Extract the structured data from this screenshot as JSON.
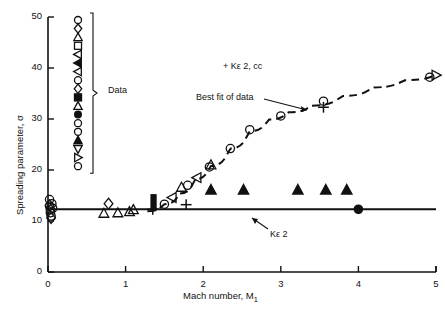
{
  "figure": {
    "background": "#ffffff",
    "ink": "#111111"
  },
  "axes": {
    "x_title": "Mach number, M",
    "x_title_sub": "1",
    "y_title": "Spreading parameter, σ",
    "x_ticks": [
      "0",
      "1",
      "2",
      "3",
      "4",
      "5"
    ],
    "y_ticks": [
      "0",
      "10",
      "20",
      "30",
      "40",
      "50"
    ]
  },
  "annotations": {
    "ke2cc": "+ Kε 2, cc",
    "best_fit": "Best fit of data",
    "ke2": "Kε 2",
    "data_legend": "Data"
  },
  "legend_symbols": [
    "circle-open",
    "diamond-open",
    "triangle-up-small-open",
    "square-open",
    "triangle-left-open-1",
    "triangle-left-filled",
    "triangle-left-open-2",
    "circle-small-open",
    "diamond-open-2",
    "square-filled",
    "triangle-up-open",
    "circle-filled",
    "circle-open-2",
    "circle-open-3",
    "triangle-up-filled",
    "triangle-down-open",
    "triangle-right-open",
    "circle-open-4"
  ],
  "chart_data": {
    "type": "scatter",
    "title": "",
    "xlabel": "Mach number, M1",
    "ylabel": "Spreading parameter, σ",
    "xlim": [
      0,
      5
    ],
    "ylim": [
      0,
      50
    ],
    "xticks": [
      0,
      1,
      2,
      3,
      4,
      5
    ],
    "yticks": [
      0,
      10,
      20,
      30,
      40,
      50
    ],
    "grid": false,
    "legend_position": "upper-left-inset",
    "series": [
      {
        "name": "Data (open circles, subsonic cluster)",
        "marker": "circle-open",
        "points": [
          [
            0.02,
            14.2
          ],
          [
            0.02,
            12.9
          ],
          [
            0.03,
            12.2
          ],
          [
            0.03,
            11.6
          ],
          [
            0.04,
            11.0
          ],
          [
            0.05,
            13.4
          ],
          [
            0.06,
            12.5
          ]
        ]
      },
      {
        "name": "Data (open diamonds, low Mach)",
        "marker": "diamond-open",
        "points": [
          [
            0.02,
            13.1
          ],
          [
            0.04,
            10.6
          ],
          [
            0.78,
            13.4
          ]
        ]
      },
      {
        "name": "Data (open triangles, rising branch)",
        "marker": "triangle-up-open",
        "points": [
          [
            0.72,
            11.5
          ],
          [
            0.9,
            11.6
          ],
          [
            1.05,
            11.8
          ],
          [
            1.1,
            12.2
          ],
          [
            1.72,
            16.6
          ],
          [
            2.1,
            21.0
          ]
        ]
      },
      {
        "name": "Data (open circles on best-fit curve)",
        "marker": "circle-open",
        "points": [
          [
            1.5,
            13.3
          ],
          [
            1.8,
            17.0
          ],
          [
            2.08,
            20.6
          ],
          [
            2.35,
            24.2
          ],
          [
            2.6,
            27.9
          ],
          [
            3.0,
            30.6
          ],
          [
            3.55,
            33.5
          ],
          [
            4.92,
            38.2
          ]
        ]
      },
      {
        "name": "Kε 2, cc (plus symbols)",
        "marker": "plus",
        "points": [
          [
            1.35,
            12.3
          ],
          [
            1.78,
            13.2
          ],
          [
            3.55,
            32.3
          ]
        ]
      },
      {
        "name": "Kε 2 model (filled triangles)",
        "marker": "triangle-up-filled",
        "points": [
          [
            2.1,
            16.1
          ],
          [
            2.52,
            16.1
          ],
          [
            3.22,
            16.1
          ],
          [
            3.58,
            16.1
          ],
          [
            3.85,
            16.1
          ]
        ]
      },
      {
        "name": "Kε 2 model (filled circle)",
        "marker": "circle-filled",
        "points": [
          [
            4.0,
            12.3
          ]
        ]
      },
      {
        "name": "Transonic band (filled bar)",
        "marker": "bar-filled",
        "points": [
          [
            1.36,
            13.6
          ]
        ]
      },
      {
        "name": "Open left triangle markers",
        "marker": "triangle-left-open",
        "points": [
          [
            1.6,
            14.6
          ],
          [
            1.92,
            18.5
          ]
        ]
      },
      {
        "name": "Open right triangle terminus",
        "marker": "triangle-right-open",
        "points": [
          [
            5.0,
            38.6
          ]
        ]
      }
    ],
    "curves": [
      {
        "name": "Best fit of data",
        "style": "dashed",
        "points": [
          [
            1.28,
            11.9
          ],
          [
            1.5,
            13.3
          ],
          [
            1.7,
            15.4
          ],
          [
            1.9,
            18.2
          ],
          [
            2.1,
            20.8
          ],
          [
            2.35,
            24.2
          ],
          [
            2.6,
            27.6
          ],
          [
            2.85,
            29.9
          ],
          [
            3.1,
            31.3
          ],
          [
            3.4,
            32.6
          ],
          [
            3.8,
            34.5
          ],
          [
            4.2,
            36.2
          ],
          [
            4.6,
            37.6
          ],
          [
            5.0,
            38.6
          ]
        ]
      },
      {
        "name": "Kε 2",
        "style": "solid",
        "points": [
          [
            0.02,
            12.3
          ],
          [
            5.0,
            12.3
          ]
        ]
      }
    ]
  }
}
